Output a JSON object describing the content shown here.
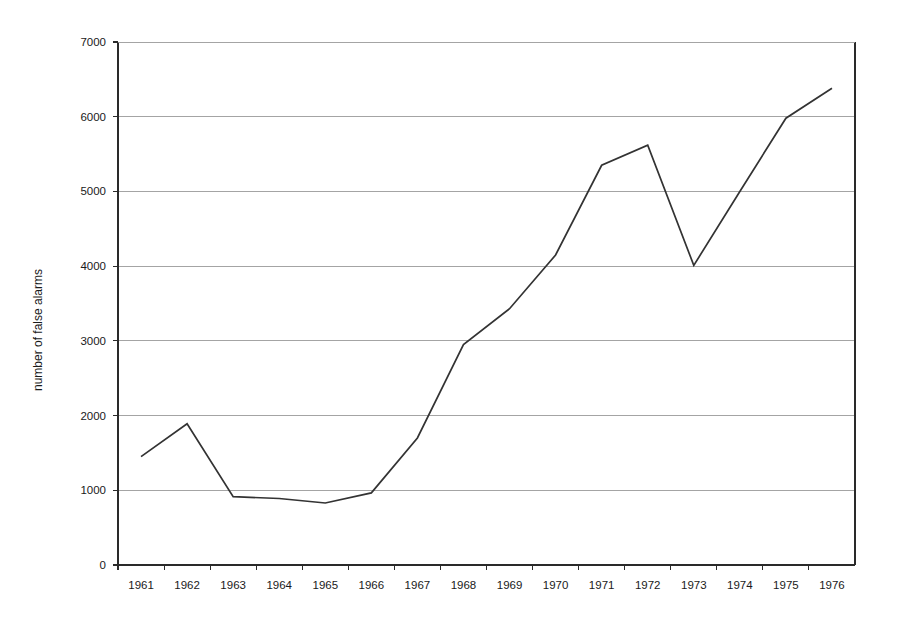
{
  "chart_data": {
    "type": "line",
    "title": "",
    "subtitle": "",
    "xlabel": "",
    "ylabel": "number of false alarms",
    "categories": [
      "1961",
      "1962",
      "1963",
      "1964",
      "1965",
      "1966",
      "1967",
      "1968",
      "1969",
      "1970",
      "1971",
      "1972",
      "1973",
      "1974",
      "1975",
      "1976"
    ],
    "values": [
      1450,
      1890,
      915,
      890,
      830,
      965,
      1700,
      2950,
      3430,
      4150,
      5350,
      5620,
      4010,
      5000,
      5980,
      6380
    ],
    "series": [
      {
        "name": "number of false alarms",
        "values": [
          1450,
          1890,
          915,
          890,
          830,
          965,
          1700,
          2950,
          3430,
          4150,
          5350,
          5620,
          4010,
          5000,
          5980,
          6380
        ]
      }
    ],
    "ylim": [
      0,
      7000
    ],
    "ytick_labels": [
      "0",
      "1000",
      "2000",
      "3000",
      "4000",
      "5000",
      "6000",
      "7000"
    ],
    "ytick_values": [
      0,
      1000,
      2000,
      3000,
      4000,
      5000,
      6000,
      7000
    ],
    "grid": true,
    "grid_axis": "y",
    "legend": false,
    "legend_position": "none",
    "line_color": "#333333",
    "grid_color": "#9a9a9a",
    "axis_color": "#2a2a2a",
    "background_color": "#ffffff",
    "markers": false
  },
  "axes": {
    "y_title": "number of false alarms",
    "x_title": ""
  }
}
